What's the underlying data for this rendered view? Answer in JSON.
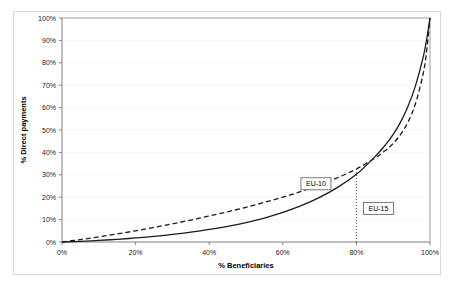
{
  "chart_data": {
    "type": "line",
    "title": "",
    "subtitle": "",
    "xlabel": "% Beneficiaries",
    "ylabel": "% Direct payments",
    "xlim": [
      0,
      100
    ],
    "ylim": [
      0,
      100
    ],
    "x_ticks": [
      "0%",
      "20%",
      "40%",
      "60%",
      "80%",
      "100%"
    ],
    "x_tick_values": [
      0,
      20,
      40,
      60,
      80,
      100
    ],
    "y_ticks": [
      "0%",
      "10%",
      "20%",
      "30%",
      "40%",
      "50%",
      "60%",
      "70%",
      "80%",
      "90%",
      "100%"
    ],
    "y_tick_values": [
      0,
      10,
      20,
      30,
      40,
      50,
      60,
      70,
      80,
      90,
      100
    ],
    "grid": "horizontal-faint",
    "legend_position": "inline-annotations",
    "x": [
      0,
      5,
      10,
      15,
      20,
      25,
      30,
      35,
      40,
      45,
      50,
      55,
      60,
      65,
      70,
      75,
      80,
      85,
      88,
      90,
      92,
      94,
      96,
      98,
      99,
      100
    ],
    "series": [
      {
        "name": "EU-10",
        "style": "dashed",
        "color": "#1a1a1a",
        "values": [
          0,
          1.1,
          2.3,
          3.6,
          5.0,
          6.5,
          8.1,
          9.8,
          11.6,
          13.5,
          15.5,
          17.7,
          20.0,
          22.6,
          25.5,
          28.8,
          32.6,
          37.4,
          41.0,
          44.0,
          48.0,
          53.5,
          61.5,
          74.0,
          84.0,
          100
        ],
        "annotation": {
          "label": "EU-10",
          "boxed": true,
          "at_x": 69,
          "at_y": 26
        }
      },
      {
        "name": "EU-15",
        "style": "solid",
        "color": "#1a1a1a",
        "values": [
          0,
          0.3,
          0.7,
          1.2,
          1.8,
          2.5,
          3.4,
          4.4,
          5.6,
          7.0,
          8.7,
          10.7,
          13.2,
          16.2,
          19.9,
          24.5,
          30.2,
          38.0,
          43.6,
          48.0,
          53.5,
          60.5,
          69.5,
          81.5,
          89.5,
          100
        ],
        "annotation": {
          "label": "EU-15",
          "boxed": true,
          "at_x": 86,
          "at_y": 15
        }
      }
    ],
    "reference_lines": [
      {
        "orientation": "vertical",
        "value": 80,
        "style": "dotted",
        "from_y": 0,
        "to_y": 32.6,
        "label": "80%"
      }
    ]
  }
}
